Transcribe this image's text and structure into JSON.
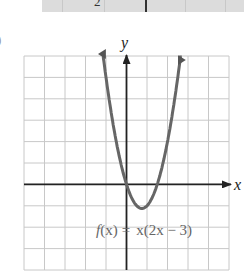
{
  "table_fragment": {
    "visible_value": "2",
    "background": "#dcdcdc"
  },
  "part_marker": ")",
  "chart_data": {
    "type": "line",
    "title": "",
    "function_label": "f(x) = x(2x − 3)",
    "function_label_parts": {
      "f": "f",
      "arg": "(x)",
      "eq": "=",
      "rhs": "x(2x − 3)"
    },
    "xlabel": "x",
    "ylabel": "y",
    "xlim": [
      -5,
      5
    ],
    "ylim": [
      -4,
      6
    ],
    "grid": true,
    "grid_step": 1,
    "series": [
      {
        "name": "f(x) = x(2x - 3)",
        "x": [
          -1.2,
          -1,
          -0.75,
          -0.5,
          -0.25,
          0,
          0.25,
          0.5,
          0.75,
          1,
          1.25,
          1.5,
          1.75,
          2,
          2.25,
          2.5,
          2.7
        ],
        "y": [
          6.48,
          5,
          3.375,
          2,
          0.875,
          0,
          -0.625,
          -1,
          -1.125,
          -1,
          -0.625,
          0,
          0.875,
          2,
          3.375,
          5,
          6.48
        ]
      }
    ],
    "key_points": {
      "x_intercepts": [
        0,
        1.5
      ],
      "vertex": [
        0.75,
        -1.125
      ]
    },
    "colors": {
      "curve": "#666666",
      "axes": "#222222",
      "grid": "#c8c8c8"
    }
  }
}
